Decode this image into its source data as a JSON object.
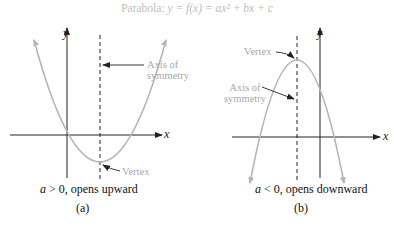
{
  "title": {
    "prefix": "Parabola: ",
    "equation": "y = f(x) = ax² + bx + c"
  },
  "panels": [
    {
      "id": "a",
      "axis_x_label": "x",
      "axis_y_label": "y",
      "annotations": {
        "axis_of_symmetry": "Axis of\nsymmetry",
        "axis_line1": "Axis of",
        "axis_line2": "symmetry",
        "vertex": "Vertex"
      },
      "caption_var": "a",
      "caption_rest": " > 0, opens upward",
      "sublabel": "(a)"
    },
    {
      "id": "b",
      "axis_x_label": "x",
      "axis_y_label": "y",
      "annotations": {
        "axis_line1": "Axis of",
        "axis_line2": "symmetry",
        "vertex": "Vertex"
      },
      "caption_var": "a",
      "caption_rest": " < 0, opens downward",
      "sublabel": "(b)"
    }
  ],
  "colors": {
    "curve": "#b5b5b5",
    "axes": "#222222",
    "annotation_text": "#a8a8a8"
  }
}
